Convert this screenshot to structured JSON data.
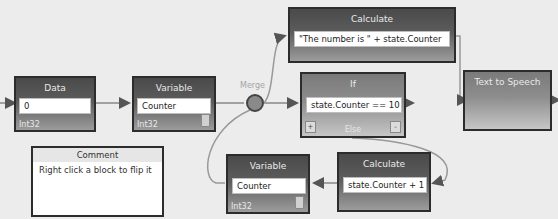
{
  "diagram": {
    "blocks": {
      "data": {
        "title": "Data",
        "value": "0",
        "type": "Int32"
      },
      "variable_top": {
        "title": "Variable",
        "value": "Counter",
        "type": "Int32"
      },
      "merge": {
        "label": "Merge"
      },
      "calculate_top": {
        "title": "Calculate",
        "value": "\"The number is \" + state.Counter"
      },
      "if": {
        "title": "If",
        "value": "state.Counter == 10",
        "else_label": "Else",
        "plus": "+",
        "minus": "-"
      },
      "text_to_speech": {
        "title": "Text to Speech"
      },
      "comment": {
        "title": "Comment",
        "body": "Right click a block to flip it"
      },
      "variable_bottom": {
        "title": "Variable",
        "value": "Counter",
        "type": "Int32"
      },
      "calculate_bottom": {
        "title": "Calculate",
        "value": "state.Counter + 1"
      }
    },
    "connections": [
      {
        "from": "data",
        "to": "variable_top"
      },
      {
        "from": "variable_top",
        "to": "merge"
      },
      {
        "from": "merge",
        "to": "calculate_top"
      },
      {
        "from": "merge",
        "to": "if"
      },
      {
        "from": "calculate_top",
        "to": "text_to_speech"
      },
      {
        "from": "if",
        "to": "calculate_bottom"
      },
      {
        "from": "calculate_bottom",
        "to": "variable_bottom"
      },
      {
        "from": "variable_bottom",
        "to": "merge"
      }
    ]
  }
}
